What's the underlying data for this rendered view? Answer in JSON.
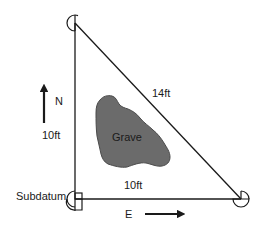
{
  "diagram": {
    "type": "site-plan",
    "colors": {
      "line": "#1a1a1a",
      "grave_fill": "#6b6b6b",
      "grave_stroke": "#4a4a4a",
      "background": "#ffffff"
    },
    "labels": {
      "north": "N",
      "east": "E",
      "north_side": "10ft",
      "bottom_side": "10ft",
      "hypotenuse": "14ft",
      "grave": "Grave",
      "subdatum": "Subdatum"
    },
    "points": {
      "top_left": {
        "x": 75,
        "y": 23
      },
      "bottom_left": {
        "x": 75,
        "y": 199
      },
      "bottom_right": {
        "x": 241,
        "y": 199
      }
    },
    "arrows": {
      "north": {
        "x": 44,
        "y1": 123,
        "y2": 84
      },
      "east": {
        "y": 214,
        "x1": 145,
        "x2": 185
      }
    }
  }
}
